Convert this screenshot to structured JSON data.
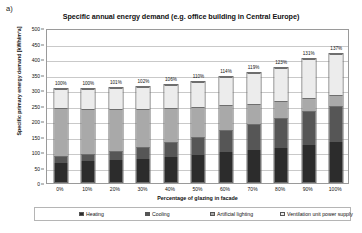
{
  "figure_label": "a)",
  "chart_data": {
    "type": "bar",
    "subtype": "stacked",
    "title": "Specific annual energy demand (e.g. office building in Central Europe)",
    "xlabel": "Percentage of glazing in facade",
    "ylabel": "Specific primary energy demand  [kWh/m²a]",
    "categories": [
      "0%",
      "10%",
      "20%",
      "30%",
      "40%",
      "50%",
      "60%",
      "70%",
      "80%",
      "90%",
      "100%"
    ],
    "ylim": [
      0,
      500
    ],
    "yticks": [
      0,
      50,
      100,
      150,
      200,
      250,
      300,
      350,
      400,
      450,
      500
    ],
    "ytick_labels": [
      "0",
      "50",
      "100",
      "150",
      "200",
      "250",
      "300",
      "350",
      "400",
      "450",
      "500"
    ],
    "grid": true,
    "legend_position": "bottom",
    "series": [
      {
        "name": "Heating",
        "color": "#2c2c2c",
        "values": [
          62,
          68,
          72,
          76,
          82,
          90,
          98,
          105,
          112,
          120,
          130
        ]
      },
      {
        "name": "Cooling",
        "color": "#565656",
        "values": [
          23,
          24,
          30,
          38,
          50,
          58,
          72,
          85,
          98,
          112,
          120
        ]
      },
      {
        "name": "Artificial lighting",
        "color": "#a9a9a9",
        "values": [
          158,
          150,
          140,
          128,
          112,
          100,
          82,
          68,
          55,
          45,
          35
        ]
      },
      {
        "name": "Ventilation unit power supply",
        "color": "#ececec",
        "values": [
          64,
          65,
          68,
          70,
          76,
          82,
          92,
          100,
          110,
          125,
          135
        ]
      }
    ],
    "totals": [
      307,
      307,
      310,
      312,
      320,
      330,
      344,
      358,
      375,
      402,
      420
    ],
    "annotations": [
      "100%",
      "100%",
      "101%",
      "102%",
      "106%",
      "110%",
      "114%",
      "119%",
      "123%",
      "131%",
      "137%"
    ]
  }
}
